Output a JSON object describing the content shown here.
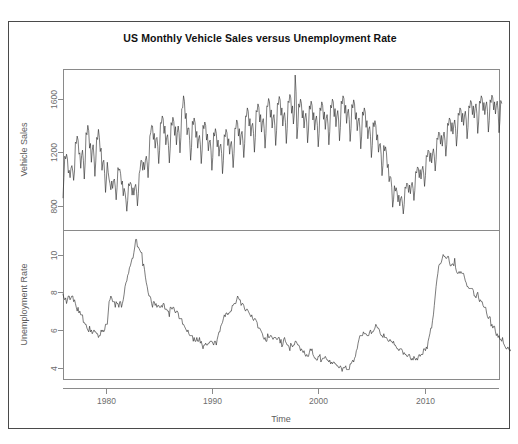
{
  "page": {
    "title": "US Monthly Vehicle Sales versus  Unemployment Rate",
    "border_color": "#4a4a4a",
    "background": "#ffffff"
  },
  "chart_data": {
    "type": "line",
    "title": "US Monthly Vehicle Sales versus  Unemployment Rate",
    "xlabel": "Time",
    "grid": false,
    "legend": null,
    "layout": "two stacked panels sharing one time axis",
    "x_ticks": [
      1980,
      1990,
      2000,
      2010
    ],
    "xlim": [
      1976.0,
      2017.0
    ],
    "x_unit": "year",
    "panels": [
      {
        "name": "vehicle-sales",
        "ylabel": "Vehicle Sales",
        "ylim": [
          620,
          1820
        ],
        "y_ticks": [
          800,
          1200,
          1600
        ],
        "line_color": "#2b2b2b",
        "series_name": "US Monthly Vehicle Sales",
        "x_start": 1976.0,
        "x_step": 0.08333333,
        "values": [
          860,
          1010,
          1170,
          1150,
          1185,
          1150,
          1045,
          1065,
          1010,
          1080,
          1100,
          1060,
          990,
          1060,
          1275,
          1265,
          1320,
          1290,
          1185,
          1195,
          1080,
          1175,
          1215,
          1140,
          1000,
          1120,
          1345,
          1330,
          1400,
          1360,
          1230,
          1265,
          1125,
          1215,
          1255,
          1165,
          1020,
          1135,
          1310,
          1295,
          1370,
          1310,
          1205,
          1230,
          1065,
          1125,
          1140,
          1040,
          900,
          1000,
          1125,
          1050,
          1000,
          965,
          920,
          985,
          930,
          990,
          1000,
          940,
          845,
          935,
          1085,
          1065,
          1075,
          1040,
          960,
          985,
          875,
          930,
          900,
          845,
          760,
          840,
          965,
          950,
          975,
          960,
          880,
          935,
          880,
          940,
          960,
          905,
          800,
          890,
          1040,
          1070,
          1140,
          1135,
          1065,
          1125,
          1070,
          1140,
          1170,
          1120,
          1010,
          1130,
          1320,
          1345,
          1400,
          1395,
          1295,
          1340,
          1230,
          1300,
          1310,
          1240,
          1115,
          1215,
          1420,
          1415,
          1470,
          1450,
          1340,
          1395,
          1255,
          1310,
          1330,
          1250,
          1120,
          1230,
          1420,
          1400,
          1460,
          1430,
          1325,
          1390,
          1255,
          1345,
          1395,
          1340,
          1195,
          1310,
          1525,
          1530,
          1620,
          1580,
          1450,
          1490,
          1330,
          1380,
          1380,
          1285,
          1140,
          1235,
          1430,
          1405,
          1455,
          1420,
          1310,
          1355,
          1230,
          1300,
          1325,
          1255,
          1115,
          1215,
          1400,
          1375,
          1425,
          1400,
          1290,
          1335,
          1210,
          1275,
          1290,
          1215,
          1065,
          1160,
          1345,
          1320,
          1375,
          1340,
          1240,
          1290,
          1170,
          1240,
          1260,
          1190,
          1040,
          1140,
          1330,
          1315,
          1370,
          1345,
          1250,
          1300,
          1185,
          1255,
          1280,
          1210,
          1085,
          1190,
          1380,
          1375,
          1440,
          1420,
          1320,
          1375,
          1255,
          1330,
          1355,
          1285,
          1160,
          1265,
          1470,
          1465,
          1530,
          1505,
          1395,
          1450,
          1320,
          1395,
          1415,
          1340,
          1200,
          1310,
          1510,
          1500,
          1560,
          1535,
          1425,
          1480,
          1350,
          1425,
          1450,
          1375,
          1230,
          1340,
          1545,
          1540,
          1600,
          1575,
          1460,
          1515,
          1380,
          1455,
          1480,
          1400,
          1250,
          1360,
          1565,
          1555,
          1615,
          1590,
          1475,
          1530,
          1395,
          1470,
          1495,
          1420,
          1265,
          1375,
          1580,
          1570,
          1630,
          1605,
          1490,
          1545,
          1410,
          1485,
          1775,
          1650,
          1300,
          1390,
          1560,
          1535,
          1595,
          1565,
          1455,
          1510,
          1380,
          1455,
          1490,
          1425,
          1270,
          1365,
          1545,
          1520,
          1580,
          1550,
          1440,
          1495,
          1365,
          1440,
          1470,
          1400,
          1240,
          1340,
          1530,
          1510,
          1575,
          1550,
          1445,
          1500,
          1370,
          1450,
          1480,
          1410,
          1255,
          1355,
          1550,
          1530,
          1595,
          1575,
          1465,
          1525,
          1390,
          1470,
          1510,
          1440,
          1285,
          1385,
          1580,
          1560,
          1620,
          1600,
          1490,
          1550,
          1415,
          1490,
          1520,
          1445,
          1280,
          1375,
          1555,
          1530,
          1590,
          1560,
          1445,
          1495,
          1360,
          1430,
          1455,
          1380,
          1225,
          1320,
          1500,
          1475,
          1530,
          1500,
          1385,
          1435,
          1300,
          1370,
          1390,
          1315,
          1160,
          1250,
          1420,
          1390,
          1435,
          1400,
          1290,
          1330,
          1200,
          1255,
          1265,
          1185,
          1025,
          1100,
          1250,
          1210,
          1240,
          1195,
          1085,
          1110,
          980,
          1020,
          1010,
          935,
          790,
          845,
          950,
          910,
          935,
          900,
          830,
          880,
          800,
          855,
          870,
          820,
          740,
          810,
          940,
          930,
          970,
          960,
          900,
          955,
          890,
          950,
          975,
          930,
          840,
          915,
          1055,
          1045,
          1090,
          1080,
          1010,
          1070,
          1000,
          1065,
          1095,
          1045,
          945,
          1025,
          1175,
          1165,
          1215,
          1205,
          1130,
          1195,
          1120,
          1190,
          1225,
          1170,
          1060,
          1145,
          1305,
          1295,
          1350,
          1340,
          1260,
          1325,
          1245,
          1315,
          1350,
          1290,
          1170,
          1255,
          1415,
          1400,
          1455,
          1440,
          1355,
          1420,
          1335,
          1405,
          1440,
          1375,
          1245,
          1330,
          1490,
          1475,
          1530,
          1515,
          1425,
          1490,
          1400,
          1470,
          1505,
          1440,
          1300,
          1385,
          1545,
          1530,
          1585,
          1570,
          1480,
          1545,
          1455,
          1525,
          1560,
          1490,
          1340,
          1425,
          1580,
          1565,
          1620,
          1600,
          1510,
          1570,
          1480,
          1545,
          1575,
          1505,
          1350,
          1435,
          1590,
          1570,
          1625,
          1605,
          1515,
          1575,
          1485,
          1550,
          1580,
          1510,
          1345,
          1430,
          1585,
          1565
        ]
      },
      {
        "name": "unemployment-rate",
        "ylabel": "Unemployment Rate",
        "ylim": [
          3.4,
          11.3
        ],
        "y_ticks": [
          4,
          6,
          8,
          10
        ],
        "line_color": "#2b2b2b",
        "series_name": "US Unemployment Rate",
        "x_start": 1976.0,
        "x_step": 0.08333333,
        "values": [
          7.9,
          7.7,
          7.6,
          7.7,
          7.4,
          7.6,
          7.8,
          7.8,
          7.6,
          7.7,
          7.8,
          7.8,
          7.5,
          7.6,
          7.4,
          7.2,
          7.0,
          7.2,
          6.9,
          7.0,
          6.8,
          6.8,
          6.8,
          6.4,
          6.4,
          6.3,
          6.3,
          6.1,
          6.0,
          5.9,
          6.2,
          5.9,
          6.0,
          5.8,
          5.9,
          6.0,
          5.9,
          5.9,
          5.8,
          5.8,
          5.6,
          5.7,
          5.7,
          6.0,
          5.9,
          6.0,
          5.9,
          6.0,
          6.3,
          6.3,
          6.3,
          6.9,
          7.5,
          7.6,
          7.8,
          7.7,
          7.5,
          7.5,
          7.5,
          7.2,
          7.5,
          7.4,
          7.4,
          7.2,
          7.5,
          7.5,
          7.2,
          7.4,
          7.6,
          7.9,
          8.3,
          8.5,
          8.6,
          8.9,
          9.0,
          9.3,
          9.4,
          9.6,
          9.8,
          9.8,
          10.1,
          10.4,
          10.8,
          10.8,
          10.4,
          10.4,
          10.3,
          10.2,
          10.1,
          10.1,
          9.4,
          9.5,
          9.2,
          8.8,
          8.5,
          8.3,
          8.0,
          7.8,
          7.8,
          7.7,
          7.4,
          7.2,
          7.5,
          7.5,
          7.3,
          7.4,
          7.2,
          7.3,
          7.3,
          7.2,
          7.2,
          7.3,
          7.2,
          7.4,
          7.4,
          7.1,
          7.1,
          7.1,
          7.0,
          7.0,
          6.7,
          7.2,
          7.2,
          7.1,
          7.2,
          7.2,
          7.0,
          6.9,
          7.0,
          7.0,
          6.9,
          6.6,
          6.6,
          6.6,
          6.6,
          6.3,
          6.3,
          6.2,
          6.1,
          6.0,
          5.9,
          6.0,
          5.8,
          5.7,
          5.7,
          5.7,
          5.7,
          5.4,
          5.6,
          5.4,
          5.4,
          5.6,
          5.4,
          5.4,
          5.6,
          5.3,
          5.4,
          5.2,
          5.0,
          5.2,
          5.2,
          5.3,
          5.2,
          5.2,
          5.3,
          5.3,
          5.4,
          5.4,
          5.4,
          5.3,
          5.2,
          5.4,
          5.4,
          5.2,
          5.5,
          5.7,
          5.9,
          5.9,
          6.2,
          6.3,
          6.4,
          6.6,
          6.8,
          6.7,
          6.9,
          6.9,
          6.8,
          6.9,
          6.9,
          7.0,
          7.0,
          7.3,
          7.3,
          7.4,
          7.4,
          7.4,
          7.6,
          7.8,
          7.7,
          7.6,
          7.6,
          7.3,
          7.4,
          7.4,
          7.3,
          7.1,
          7.0,
          7.1,
          7.1,
          7.0,
          6.9,
          6.8,
          6.7,
          6.8,
          6.6,
          6.5,
          6.6,
          6.6,
          6.5,
          6.4,
          6.1,
          6.1,
          6.1,
          6.0,
          5.9,
          5.8,
          5.6,
          5.5,
          5.6,
          5.4,
          5.4,
          5.8,
          5.6,
          5.6,
          5.7,
          5.7,
          5.6,
          5.5,
          5.6,
          5.6,
          5.6,
          5.5,
          5.5,
          5.6,
          5.6,
          5.3,
          5.5,
          5.1,
          5.2,
          5.5,
          5.6,
          5.4,
          5.3,
          5.2,
          5.2,
          5.1,
          4.9,
          5.3,
          5.2,
          5.1,
          5.2,
          5.2,
          5.4,
          5.4,
          5.3,
          5.2,
          5.2,
          5.1,
          4.9,
          5.0,
          4.9,
          4.8,
          4.9,
          4.7,
          4.6,
          4.7,
          4.6,
          4.6,
          4.8,
          5.0,
          4.9,
          5.0,
          4.7,
          4.6,
          4.5,
          4.5,
          4.4,
          4.4,
          4.6,
          4.6,
          4.7,
          4.3,
          4.4,
          4.5,
          4.5,
          4.5,
          4.6,
          4.5,
          4.4,
          4.4,
          4.3,
          4.4,
          4.2,
          4.3,
          4.2,
          4.3,
          4.3,
          4.2,
          4.2,
          4.1,
          4.1,
          4.0,
          4.0,
          4.1,
          4.0,
          3.8,
          4.0,
          4.0,
          4.0,
          4.1,
          3.9,
          3.9,
          3.9,
          3.9,
          4.2,
          4.2,
          4.3,
          4.4,
          4.3,
          4.5,
          4.6,
          4.9,
          5.0,
          5.3,
          5.5,
          5.7,
          5.7,
          5.7,
          5.7,
          5.9,
          5.8,
          5.8,
          5.8,
          5.7,
          5.7,
          5.7,
          5.9,
          6.0,
          5.8,
          5.9,
          5.9,
          6.0,
          6.1,
          6.3,
          6.2,
          6.1,
          6.1,
          6.0,
          5.8,
          5.7,
          5.7,
          5.6,
          5.8,
          5.6,
          5.6,
          5.6,
          5.5,
          5.4,
          5.4,
          5.5,
          5.4,
          5.4,
          5.3,
          5.4,
          5.2,
          5.2,
          5.1,
          5.0,
          5.0,
          4.9,
          5.0,
          5.0,
          5.0,
          4.9,
          4.7,
          4.8,
          4.7,
          4.7,
          4.6,
          4.6,
          4.7,
          4.7,
          4.5,
          4.4,
          4.5,
          4.4,
          4.6,
          4.5,
          4.4,
          4.5,
          4.4,
          4.6,
          4.7,
          4.6,
          4.7,
          4.7,
          4.7,
          5.0,
          5.0,
          4.9,
          5.1,
          5.0,
          5.4,
          5.6,
          5.8,
          6.1,
          6.1,
          6.5,
          6.8,
          7.3,
          7.8,
          8.3,
          8.7,
          9.0,
          9.4,
          9.5,
          9.5,
          9.6,
          9.8,
          10.0,
          9.9,
          9.9,
          9.8,
          9.8,
          9.9,
          9.9,
          9.6,
          9.4,
          9.4,
          9.5,
          9.5,
          9.4,
          9.8,
          9.3,
          9.1,
          9.0,
          9.0,
          9.1,
          9.0,
          9.1,
          9.0,
          9.0,
          9.0,
          8.8,
          8.6,
          8.5,
          8.3,
          8.3,
          8.2,
          8.2,
          8.2,
          8.2,
          8.2,
          8.1,
          7.8,
          7.8,
          7.7,
          7.9,
          8.0,
          7.7,
          7.5,
          7.6,
          7.5,
          7.5,
          7.3,
          7.2,
          7.2,
          7.2,
          6.9,
          6.7,
          6.6,
          6.7,
          6.7,
          6.2,
          6.3,
          6.1,
          6.2,
          6.2,
          5.9,
          5.7,
          5.8,
          5.6,
          5.7,
          5.5,
          5.5,
          5.4,
          5.6,
          5.3,
          5.2,
          5.1,
          5.0,
          5.0,
          5.1,
          5.0,
          4.9,
          4.9,
          5.0,
          5.0,
          4.7,
          4.9,
          4.8,
          4.9,
          5.0,
          4.9,
          4.7,
          4.7,
          4.8,
          4.7,
          4.5,
          4.4,
          4.4,
          4.3,
          4.3,
          4.4,
          4.2,
          4.1,
          4.2,
          4.1
        ]
      }
    ]
  }
}
